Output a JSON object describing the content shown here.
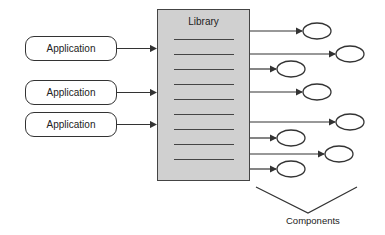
{
  "diagram": {
    "applications": [
      {
        "label": "Application",
        "x": 25,
        "y": 36
      },
      {
        "label": "Application",
        "x": 25,
        "y": 80
      },
      {
        "label": "Application",
        "x": 25,
        "y": 112
      }
    ],
    "library": {
      "title": "Library",
      "line_count": 9
    },
    "components": {
      "label": "Components",
      "ellipses": [
        {
          "cx": 317,
          "cy": 31,
          "arrow_y": 31
        },
        {
          "cx": 350,
          "cy": 54,
          "arrow_y": 54
        },
        {
          "cx": 291,
          "cy": 69,
          "arrow_y": 69
        },
        {
          "cx": 317,
          "cy": 92,
          "arrow_y": 92
        },
        {
          "cx": 350,
          "cy": 122,
          "arrow_y": 122
        },
        {
          "cx": 291,
          "cy": 138,
          "arrow_y": 138
        },
        {
          "cx": 339,
          "cy": 154,
          "arrow_y": 154
        },
        {
          "cx": 291,
          "cy": 169,
          "arrow_y": 169
        }
      ]
    },
    "colors": {
      "library_fill": "#d0d0d0",
      "stroke": "#333333"
    }
  }
}
